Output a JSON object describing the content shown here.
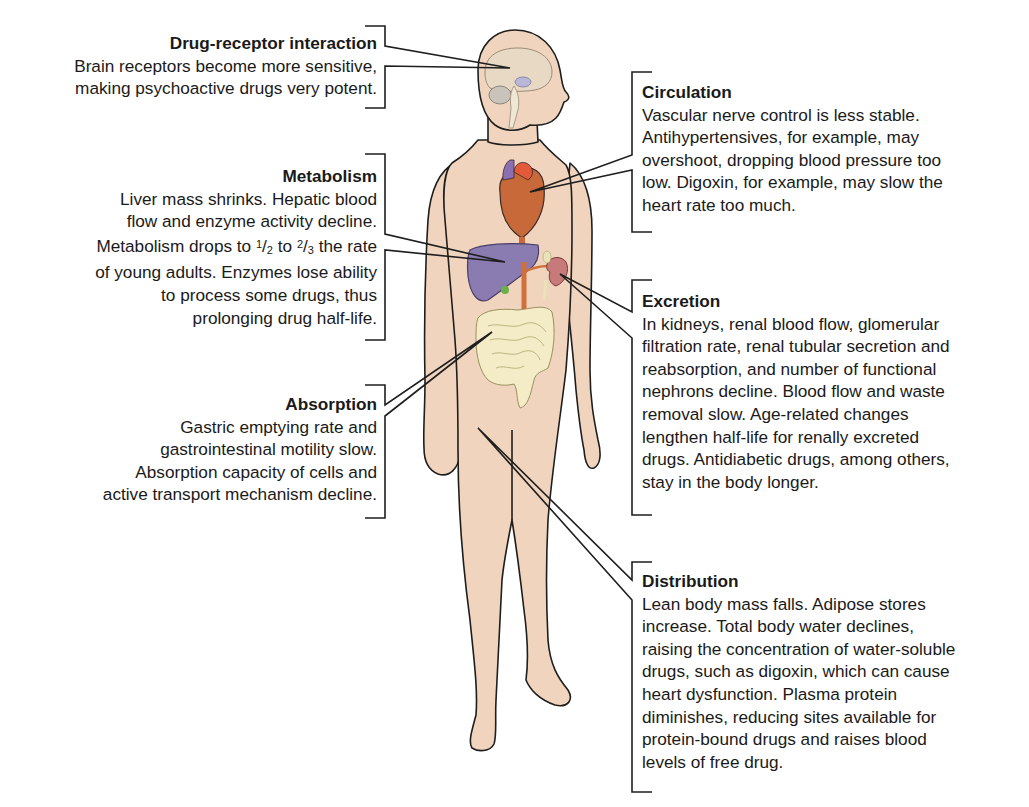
{
  "figure": {
    "colors": {
      "skin": "#f0d4bd",
      "outline": "#1e1e1e",
      "liver": "#8a7bb0",
      "heart": "#c8693a",
      "intestine": "#f3ecc6",
      "kidney": "#c77a7a",
      "aorta": "#d0703a",
      "brain": "#e7d9c4"
    }
  },
  "labels": {
    "drug_receptor": {
      "title": "Drug-receptor interaction",
      "lines": [
        "Brain receptors become more sensitive,",
        "making psychoactive drugs very potent."
      ]
    },
    "metabolism": {
      "title": "Metabolism",
      "lines": [
        "Liver mass shrinks. Hepatic blood",
        "flow and enzyme activity decline.",
        "Metabolism drops to",
        "to",
        "the rate",
        "of young adults. Enzymes lose ability",
        "to process some drugs, thus",
        "prolonging drug half-life."
      ],
      "fraction1_num": "1",
      "fraction1_sep": "/",
      "fraction1_den": "2",
      "fraction2_num": "2",
      "fraction2_sep": "/",
      "fraction2_den": "3"
    },
    "absorption": {
      "title": "Absorption",
      "lines": [
        "Gastric emptying rate and",
        "gastrointestinal motility slow.",
        "Absorption capacity of cells and",
        "active transport mechanism decline."
      ]
    },
    "circulation": {
      "title": "Circulation",
      "lines": [
        "Vascular nerve control is less stable.",
        "Antihypertensives, for example, may",
        "overshoot, dropping blood pressure too",
        "low. Digoxin, for example, may slow the",
        "heart rate too much."
      ]
    },
    "excretion": {
      "title": "Excretion",
      "lines": [
        "In kidneys, renal blood flow, glomerular",
        "filtration rate, renal tubular secretion and",
        "reabsorption, and number of functional",
        "nephrons decline. Blood flow and waste",
        "removal slow. Age-related changes",
        "lengthen half-life for renally excreted",
        "drugs. Antidiabetic drugs, among others,",
        "stay in the body longer."
      ]
    },
    "distribution": {
      "title": "Distribution",
      "lines": [
        "Lean body mass falls. Adipose stores",
        "increase. Total body water declines,",
        "raising the concentration of water-soluble",
        "drugs, such as digoxin, which can cause",
        "heart dysfunction. Plasma protein",
        "diminishes, reducing sites available for",
        "protein-bound drugs and raises blood",
        "levels of free drug."
      ]
    }
  }
}
